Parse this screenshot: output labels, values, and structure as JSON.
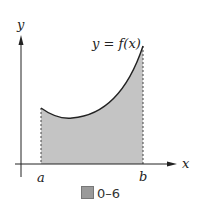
{
  "figure": {
    "caption_label": "0–6",
    "caption_icon": "figure-glyph-icon",
    "curve_label": "y = f(x)",
    "y_axis_label": "y",
    "x_axis_label": "x",
    "lower_bound_label": "a",
    "upper_bound_label": "b",
    "shade_color": "#c4c4c4",
    "line_color": "#222222"
  }
}
